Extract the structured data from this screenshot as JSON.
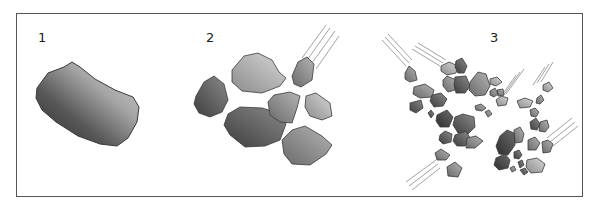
{
  "diagram": {
    "frame": {
      "x": 16,
      "y": 13,
      "w": 567,
      "h": 184,
      "stroke": "#555555"
    },
    "colors": {
      "outline": "#3a3a3a",
      "light": "#c9c9c9",
      "mid": "#9a9a9a",
      "dark": "#5e5e5e",
      "darker": "#454545",
      "streak": "#8a8a8a"
    },
    "panels": [
      {
        "id": "1",
        "label": "1",
        "label_pos": {
          "x": 38,
          "y": 40
        },
        "description": "Intact asteroid",
        "bodies": [
          {
            "shade": "gradient-big",
            "points": "37,88 48,73 64,67 72,62 80,67 95,79 115,90 133,97 139,107 137,122 128,138 117,146 100,144 78,136 56,122 42,110 36,98"
          }
        ],
        "streaks": []
      },
      {
        "id": "2",
        "label": "2",
        "label_pos": {
          "x": 206,
          "y": 40
        },
        "description": "Asteroid broken into large fragments",
        "bodies": [
          {
            "shade": "dark",
            "points": "196,96 204,82 214,76 224,84 228,100 222,112 210,117 199,113 194,104"
          },
          {
            "shade": "light",
            "points": "232,70 244,56 258,53 272,60 279,72 286,78 280,86 262,93 242,91 232,82"
          },
          {
            "shade": "dark",
            "points": "228,114 240,107 262,108 282,114 286,124 280,140 265,146 245,147 230,135 224,125"
          },
          {
            "shade": "mid",
            "points": "268,102 274,95 290,92 300,96 297,108 292,123 280,122 270,115"
          },
          {
            "shade": "mid",
            "points": "292,76 298,62 307,57 314,64 312,80 301,87 294,84"
          },
          {
            "shade": "light",
            "points": "306,96 316,93 330,103 332,116 322,120 310,116 305,107"
          },
          {
            "shade": "mid",
            "points": "282,140 292,130 305,126 322,136 332,145 326,154 310,165 292,164 284,154"
          }
        ],
        "streaks": [
          {
            "x1": 302,
            "y1": 58,
            "x2": 326,
            "y2": 25
          },
          {
            "x1": 307,
            "y1": 60,
            "x2": 330,
            "y2": 28
          },
          {
            "x1": 312,
            "y1": 63,
            "x2": 335,
            "y2": 31
          },
          {
            "x1": 316,
            "y1": 69,
            "x2": 339,
            "y2": 36
          }
        ]
      },
      {
        "id": "3",
        "label": "3",
        "label_pos": {
          "x": 490,
          "y": 40
        },
        "description": "Rubble pile with impacting fragments",
        "bodies": [
          {
            "shade": "mid",
            "points": "405,73 409,66 415,71 417,80 410,82 405,79"
          },
          {
            "shade": "light",
            "points": "441,66 449,62 458,66 456,73 447,75 441,71"
          },
          {
            "shade": "dark",
            "points": "456,61 462,58 467,66 464,73 458,73 455,67"
          },
          {
            "shade": "mid",
            "points": "443,80 447,76 456,80 455,90 448,92 443,86"
          },
          {
            "shade": "dark",
            "points": "455,77 466,76 470,86 465,93 456,93 454,85"
          },
          {
            "shade": "mid",
            "points": "470,82 478,72 486,74 490,86 485,95 475,96 469,90"
          },
          {
            "shade": "light",
            "points": "490,79 497,77 502,82 496,86 490,84"
          },
          {
            "shade": "mid",
            "points": "490,91 495,88 498,94 494,97 490,95"
          },
          {
            "shade": "mid",
            "points": "414,87 425,84 434,90 432,97 420,98 413,94"
          },
          {
            "shade": "dark",
            "points": "432,95 441,93 447,99 443,106 434,107 430,101"
          },
          {
            "shade": "dark",
            "points": "410,103 421,100 423,108 416,113 410,110"
          },
          {
            "shade": "dark",
            "points": "428,113 431,110 434,114 431,118"
          },
          {
            "shade": "mid",
            "points": "475,106 481,104 486,108 482,111 476,110"
          },
          {
            "shade": "mid",
            "points": "485,112 489,110 492,114 488,117"
          },
          {
            "shade": "light",
            "points": "496,100 501,96 508,98 506,105 498,106"
          },
          {
            "shade": "darker",
            "points": "437,115 447,110 453,117 449,127 440,127 436,121"
          },
          {
            "shade": "dark",
            "points": "455,117 463,114 474,117 475,127 468,134 458,133 453,125"
          },
          {
            "shade": "dark",
            "points": "440,135 445,131 452,134 451,142 443,144 439,140"
          },
          {
            "shade": "dark",
            "points": "455,135 466,131 470,138 465,146 457,146 453,141"
          },
          {
            "shade": "mid",
            "points": "467,138 476,136 483,141 475,148 466,148"
          },
          {
            "shade": "mid",
            "points": "435,153 441,149 450,155 446,160 437,160"
          },
          {
            "shade": "light",
            "points": "517,101 525,98 533,101 530,107 520,108"
          },
          {
            "shade": "mid",
            "points": "537,98 541,95 544,100 540,104 536,103"
          },
          {
            "shade": "mid",
            "points": "530,110 535,108 539,112 536,117 531,116"
          },
          {
            "shade": "dark",
            "points": "530,122 536,118 540,124 537,130 531,129"
          },
          {
            "shade": "mid",
            "points": "540,122 547,120 549,127 545,132 539,131"
          },
          {
            "shade": "darker",
            "points": "500,136 507,130 514,133 515,145 508,155 499,154 496,146"
          },
          {
            "shade": "mid",
            "points": "514,130 520,127 524,134 522,142 515,143"
          },
          {
            "shade": "mid",
            "points": "528,140 535,137 540,143 536,150 528,150"
          },
          {
            "shade": "mid",
            "points": "542,142 548,140 553,144 550,152 543,153"
          },
          {
            "shade": "darker",
            "points": "496,158 505,154 510,160 508,168 499,170 494,165"
          },
          {
            "shade": "dark",
            "points": "514,152 519,150 522,155 519,159 514,158"
          },
          {
            "shade": "dark",
            "points": "518,162 522,160 524,165 520,168"
          },
          {
            "shade": "mid",
            "points": "510,168 514,166 516,170 512,172"
          },
          {
            "shade": "light",
            "points": "527,160 537,158 545,164 542,172 531,173 526,167"
          },
          {
            "shade": "dark",
            "points": "520,170 525,168 528,172 524,175"
          },
          {
            "shade": "mid",
            "points": "447,167 455,162 462,168 458,177 448,176"
          },
          {
            "shade": "light",
            "points": "543,85 549,82 553,88 548,92 543,90"
          },
          {
            "shade": "mid",
            "points": "497,90 503,89 504,95 498,96"
          }
        ],
        "streaks": [
          {
            "x1": 382,
            "y1": 40,
            "x2": 406,
            "y2": 66
          },
          {
            "x1": 385,
            "y1": 37,
            "x2": 409,
            "y2": 63
          },
          {
            "x1": 388,
            "y1": 34,
            "x2": 412,
            "y2": 60
          },
          {
            "x1": 412,
            "y1": 49,
            "x2": 440,
            "y2": 66
          },
          {
            "x1": 415,
            "y1": 46,
            "x2": 443,
            "y2": 63
          },
          {
            "x1": 418,
            "y1": 43,
            "x2": 446,
            "y2": 60
          },
          {
            "x1": 516,
            "y1": 75,
            "x2": 500,
            "y2": 98
          },
          {
            "x1": 520,
            "y1": 72,
            "x2": 503,
            "y2": 96
          },
          {
            "x1": 524,
            "y1": 69,
            "x2": 506,
            "y2": 94
          },
          {
            "x1": 545,
            "y1": 67,
            "x2": 533,
            "y2": 85
          },
          {
            "x1": 549,
            "y1": 64,
            "x2": 537,
            "y2": 83
          },
          {
            "x1": 553,
            "y1": 62,
            "x2": 541,
            "y2": 82
          },
          {
            "x1": 572,
            "y1": 118,
            "x2": 547,
            "y2": 138
          },
          {
            "x1": 575,
            "y1": 122,
            "x2": 550,
            "y2": 142
          },
          {
            "x1": 578,
            "y1": 126,
            "x2": 553,
            "y2": 146
          },
          {
            "x1": 436,
            "y1": 160,
            "x2": 406,
            "y2": 182
          },
          {
            "x1": 438,
            "y1": 164,
            "x2": 409,
            "y2": 186
          },
          {
            "x1": 440,
            "y1": 168,
            "x2": 412,
            "y2": 190
          }
        ]
      }
    ]
  }
}
